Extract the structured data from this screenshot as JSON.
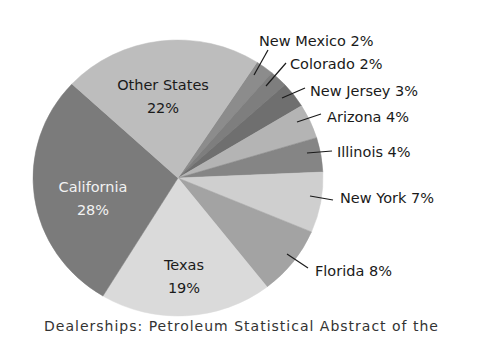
{
  "chart_data": {
    "type": "pie",
    "title": "",
    "categories": [
      "New Mexico",
      "Colorado",
      "New Jersey",
      "Arizona",
      "Illinois",
      "New York",
      "Florida",
      "Texas",
      "California",
      "Other States"
    ],
    "values": [
      2,
      2,
      3,
      4,
      4,
      7,
      8,
      19,
      28,
      22
    ],
    "unit": "%",
    "labels": [
      "New Mexico 2%",
      "Colorado 2%",
      "New Jersey 3%",
      "Arizona 4%",
      "Illinois 4%",
      "New York 7%",
      "Florida 8%",
      "Texas 19%",
      "California 28%",
      "Other States 22%"
    ],
    "colors": [
      "#8c8c8c",
      "#7e7e7e",
      "#6f6f6f",
      "#b4b4b4",
      "#858585",
      "#cfcfcf",
      "#a3a3a3",
      "#dadada",
      "#7b7b7b",
      "#bdbdbd"
    ],
    "inside_labels": [
      {
        "slice": "Other States",
        "line1": "Other States",
        "line2": "22%",
        "x": 163,
        "y": 90,
        "light": false
      },
      {
        "slice": "California",
        "line1": "California",
        "line2": "28%",
        "x": 93,
        "y": 192,
        "light": true
      },
      {
        "slice": "Texas",
        "line1": "Texas",
        "line2": "19%",
        "x": 184,
        "y": 270,
        "light": false
      }
    ],
    "callouts": [
      {
        "slice": "New Mexico",
        "text": "New Mexico 2%",
        "tx": 259,
        "ty": 46,
        "x1": 254,
        "y1": 75,
        "x2": 268,
        "y2": 50
      },
      {
        "slice": "Colorado",
        "text": "Colorado 2%",
        "tx": 290,
        "ty": 69,
        "x1": 266,
        "y1": 86,
        "x2": 286,
        "y2": 63
      },
      {
        "slice": "New Jersey",
        "text": "New Jersey 3%",
        "tx": 310,
        "ty": 96,
        "x1": 282,
        "y1": 98,
        "x2": 305,
        "y2": 88
      },
      {
        "slice": "Arizona",
        "text": "Arizona 4%",
        "tx": 327,
        "ty": 122,
        "x1": 297,
        "y1": 122,
        "x2": 321,
        "y2": 114
      },
      {
        "slice": "Illinois",
        "text": "Illinois 4%",
        "tx": 337,
        "ty": 157,
        "x1": 307,
        "y1": 153,
        "x2": 332,
        "y2": 151
      },
      {
        "slice": "New York",
        "text": "New York 7%",
        "tx": 340,
        "ty": 203,
        "x1": 310,
        "y1": 196,
        "x2": 333,
        "y2": 200
      },
      {
        "slice": "Florida",
        "text": "Florida 8%",
        "tx": 315,
        "ty": 276,
        "x1": 287,
        "y1": 254,
        "x2": 308,
        "y2": 268
      }
    ],
    "geometry": {
      "cx": 178,
      "cy": 178,
      "rx": 145,
      "ry": 138,
      "start_angle_deg": -57
    },
    "legend": "none",
    "grid": false
  },
  "caption": {
    "text": "Dealerships: Petroleum Statistical Abstract of the"
  }
}
